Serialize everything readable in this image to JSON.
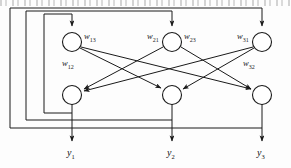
{
  "figure": {
    "name": "recurrent-neural-network-diagram",
    "type": "neural-network-schematic",
    "stroke_color": "#1a1a1a",
    "background_color": "#fdfdfd"
  },
  "top_row_nodes": [
    {
      "id": "n1",
      "cx": 72,
      "cy": 42,
      "r": 9.5
    },
    {
      "id": "n2",
      "cx": 172,
      "cy": 42,
      "r": 9.5
    },
    {
      "id": "n3",
      "cx": 262,
      "cy": 42,
      "r": 9.5
    }
  ],
  "bottom_row_nodes": [
    {
      "id": "m1",
      "cx": 72,
      "cy": 95,
      "r": 9.5
    },
    {
      "id": "m2",
      "cx": 172,
      "cy": 95,
      "r": 9.5
    },
    {
      "id": "m3",
      "cx": 262,
      "cy": 95,
      "r": 9.5
    }
  ],
  "weight_labels": [
    {
      "name": "w13",
      "w": "w",
      "sub": "13",
      "x": 84,
      "y": 36
    },
    {
      "name": "w21",
      "w": "w",
      "sub": "21",
      "x": 147,
      "y": 36
    },
    {
      "name": "w23",
      "w": "w",
      "sub": "23",
      "x": 184,
      "y": 36
    },
    {
      "name": "w31",
      "w": "w",
      "sub": "31",
      "x": 237,
      "y": 36
    },
    {
      "name": "w12",
      "w": "w",
      "sub": "12",
      "x": 62,
      "y": 63
    },
    {
      "name": "w32",
      "w": "w",
      "sub": "32",
      "x": 243,
      "y": 63
    }
  ],
  "output_labels": [
    {
      "name": "y1",
      "y": "y",
      "sub": "1",
      "x": 67,
      "ypos": 152
    },
    {
      "name": "y2",
      "y": "y",
      "sub": "2",
      "x": 167,
      "ypos": 152
    },
    {
      "name": "y3",
      "y": "y",
      "sub": "3",
      "x": 257,
      "ypos": 152
    }
  ],
  "feedback_loops": [
    {
      "name": "inner-loop-y1",
      "left": 44,
      "top": 14,
      "bottom": 113,
      "enters_node": "n1"
    },
    {
      "name": "middle-loop-y2",
      "left": 26,
      "top": 11,
      "bottom": 120,
      "enters_node": "n2"
    },
    {
      "name": "outer-loop-y3",
      "left": 10,
      "top": 8,
      "bottom": 128,
      "enters_node": "n3"
    }
  ],
  "cross_connections": [
    {
      "from": "n1",
      "to": "m2"
    },
    {
      "from": "n1",
      "to": "m3"
    },
    {
      "from": "n2",
      "to": "m1"
    },
    {
      "from": "n2",
      "to": "m3"
    },
    {
      "from": "n3",
      "to": "m1"
    },
    {
      "from": "n3",
      "to": "m2"
    }
  ],
  "top_artifact": {
    "name": "scan-artifact-text-row",
    "description": "cropped illegible text fragments"
  }
}
